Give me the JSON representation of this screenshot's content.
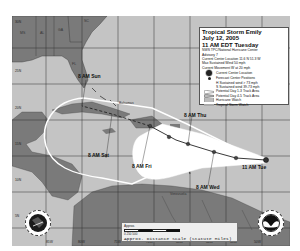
{
  "legend": {
    "title": "Tropical Storm Emily",
    "date": "July 12, 2005",
    "time": "11 AM EDT Tuesday",
    "agency": "NWS TPC/National Hurricane Center",
    "advisory": "Advisory 7",
    "current_location": "Current Center Location 11.6 N 51.3 W",
    "max_wind": "Max Sustained Wind 50 mph",
    "movement": "Current Movement W at 20 mph",
    "items": [
      {
        "symbol": "large-dot",
        "label": "Current Center Location"
      },
      {
        "symbol": "small-dot",
        "label": "Forecast Center Positions"
      },
      {
        "symbol": "H",
        "label": "H  Sustained wind > 73 mph"
      },
      {
        "symbol": "S",
        "label": "S  Sustained wind 39-73 mph"
      },
      {
        "symbol": "cone-white",
        "label": "Potential Day 1-3 Track Area"
      },
      {
        "symbol": "cone-outline",
        "label": "Potential Day 4-5 Track Area"
      },
      {
        "symbol": "hatch",
        "label": "Hurricane Watch"
      },
      {
        "symbol": "gray-line",
        "label": "Tropical Storm Watch"
      }
    ]
  },
  "forecast_labels": {
    "tue": "11 AM Tue",
    "wed": "8 AM Wed",
    "thu": "8 AM Thu",
    "fri": "8 AM Fri",
    "sat": "8 AM Sat",
    "sun": "8 AM Sun"
  },
  "places": {
    "bermuda": "Bermuda",
    "bahamas": "Bahamas",
    "venezuela": "Venezuela",
    "ga": "GA",
    "al": "AL",
    "ms": "MS",
    "sc": "SC",
    "fl": "FL"
  },
  "lat_ticks": [
    "30N",
    "25N",
    "20N",
    "15N",
    "10N",
    "5N"
  ],
  "lon_ticks": [
    "85W",
    "80W",
    "75W",
    "70W",
    "65W",
    "60W",
    "55W",
    "50W"
  ],
  "scale": {
    "approx": "Approx.",
    "numbers": "0  250  500",
    "caption": "Approx. Distance Scale (Statute Miles)"
  },
  "logos": {
    "left": "NWS",
    "right": "NOAA"
  },
  "colors": {
    "water": "#c4c4c4",
    "land": "#7a7a7a",
    "cone": "#ffffff",
    "track": "#222222",
    "grid": "#333333"
  }
}
